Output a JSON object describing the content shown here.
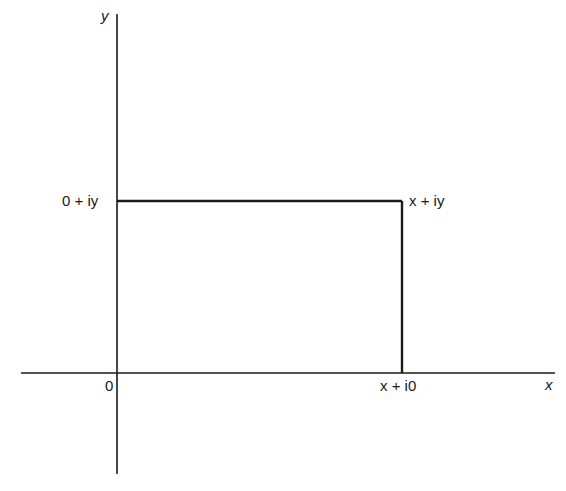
{
  "diagram": {
    "type": "complex-plane-rectangle",
    "axes": {
      "x_label": "x",
      "y_label": "y",
      "origin_label": "0"
    },
    "points": {
      "top_left": "0 + iy",
      "top_right": "x + iy",
      "bottom_right": "x + i0"
    },
    "colors": {
      "line": "#1a1a1a",
      "background": "#ffffff"
    }
  }
}
